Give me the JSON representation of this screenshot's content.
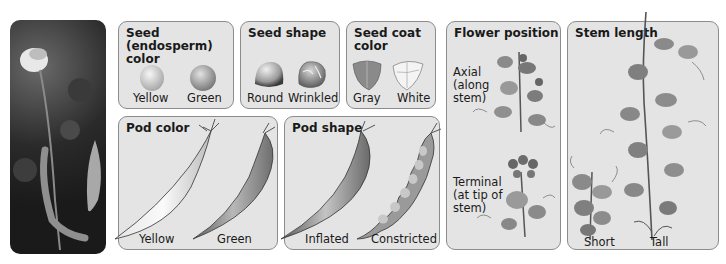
{
  "photo": {
    "description": "Pea plant photograph with white flower and pods"
  },
  "panels": {
    "seed_color": {
      "title": "Seed (endosperm) color",
      "title_line1": "Seed (endosperm)",
      "title_line2": "color",
      "traits": [
        "Yellow",
        "Green"
      ]
    },
    "seed_shape": {
      "title": "Seed shape",
      "traits": [
        "Round",
        "Wrinkled"
      ]
    },
    "seed_coat": {
      "title": "Seed coat color",
      "title_line1": "Seed coat",
      "title_line2": "color",
      "traits": [
        "Gray",
        "White"
      ]
    },
    "pod_color": {
      "title": "Pod color",
      "traits": [
        "Yellow",
        "Green"
      ]
    },
    "pod_shape": {
      "title": "Pod shape",
      "traits": [
        "Inflated",
        "Constricted"
      ]
    },
    "flower_position": {
      "title": "Flower position",
      "traits": [
        {
          "label_lines": [
            "Axial",
            "(along",
            "stem)"
          ]
        },
        {
          "label_lines": [
            "Terminal",
            "(at tip of",
            "stem)"
          ]
        }
      ]
    },
    "stem_length": {
      "title": "Stem length",
      "traits": [
        "Short",
        "Tall"
      ]
    }
  },
  "colors": {
    "panel_bg": "#e4e4e4",
    "panel_border": "#8c8c8c",
    "text": "#1a1a1a"
  }
}
